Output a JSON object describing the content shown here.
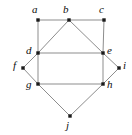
{
  "figure": {
    "name": "graph-diagram",
    "width": 132,
    "height": 135,
    "background_color": "#ffffff",
    "edge_color": "#8d8d8d",
    "vertex_color": "#1a1a1a",
    "label_color": "#0d0d0d"
  },
  "chart_data": {
    "type": "diagram",
    "title": "",
    "nodes": [
      {
        "id": "a",
        "label": "a",
        "x": 38,
        "y": 20,
        "label_x": 32,
        "label_y": 4
      },
      {
        "id": "b",
        "label": "b",
        "x": 69,
        "y": 20,
        "label_x": 63,
        "label_y": 4
      },
      {
        "id": "c",
        "label": "c",
        "x": 104,
        "y": 20,
        "label_x": 99,
        "label_y": 4
      },
      {
        "id": "d",
        "label": "d",
        "x": 38,
        "y": 53,
        "label_x": 26,
        "label_y": 45
      },
      {
        "id": "e",
        "label": "e",
        "x": 103,
        "y": 53,
        "label_x": 107,
        "label_y": 45
      },
      {
        "id": "f",
        "label": "f",
        "x": 23,
        "y": 68,
        "label_x": 13,
        "label_y": 60
      },
      {
        "id": "g",
        "label": "g",
        "x": 38,
        "y": 84,
        "label_x": 26,
        "label_y": 79
      },
      {
        "id": "h",
        "label": "h",
        "x": 103,
        "y": 84,
        "label_x": 107,
        "label_y": 79
      },
      {
        "id": "i",
        "label": "i",
        "x": 119,
        "y": 68,
        "label_x": 123,
        "label_y": 60
      },
      {
        "id": "j",
        "label": "j",
        "x": 70,
        "y": 116,
        "label_x": 66,
        "label_y": 120
      }
    ],
    "edges": [
      {
        "from": "a",
        "to": "b"
      },
      {
        "from": "b",
        "to": "c"
      },
      {
        "from": "a",
        "to": "d"
      },
      {
        "from": "c",
        "to": "e"
      },
      {
        "from": "d",
        "to": "b"
      },
      {
        "from": "b",
        "to": "e"
      },
      {
        "from": "d",
        "to": "e"
      },
      {
        "from": "d",
        "to": "f"
      },
      {
        "from": "f",
        "to": "g"
      },
      {
        "from": "e",
        "to": "i"
      },
      {
        "from": "i",
        "to": "h"
      },
      {
        "from": "d",
        "to": "g"
      },
      {
        "from": "e",
        "to": "h"
      },
      {
        "from": "g",
        "to": "h"
      },
      {
        "from": "g",
        "to": "j"
      },
      {
        "from": "j",
        "to": "h"
      }
    ]
  }
}
